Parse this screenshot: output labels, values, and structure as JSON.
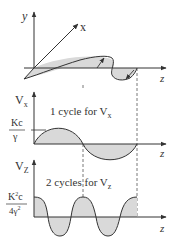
{
  "colors": {
    "line": "#333333",
    "fill": "#d9d9d9",
    "dashed": "#555555",
    "background": "#ffffff"
  },
  "panel_3d": {
    "axis_labels": {
      "y": "y",
      "x": "x",
      "z": "z"
    }
  },
  "panel_vx": {
    "axis_label_main": "V",
    "axis_label_sub": "x",
    "z_label": "z",
    "annotation_main": "1 cycle for V",
    "annotation_sub": "x",
    "amplitude_label_num": "Kc",
    "amplitude_label_den": "γ",
    "cycles": 1
  },
  "panel_vz": {
    "axis_label_main": "V",
    "axis_label_sub": "Z",
    "z_label": "z",
    "annotation_main": "2 cycles for V",
    "annotation_sub": "z",
    "amplitude_label_num_main": "K",
    "amplitude_label_num_sup": "2",
    "amplitude_label_num_tail": "c",
    "amplitude_label_den_main": "4γ",
    "amplitude_label_den_sup": "2",
    "cycles": 2
  }
}
